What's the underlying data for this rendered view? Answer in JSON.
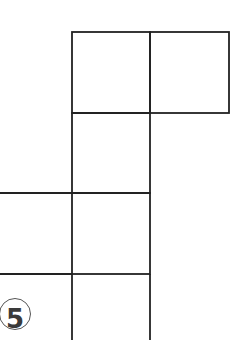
{
  "figure": {
    "label": "5",
    "line_color": "#222222",
    "cells": [
      {
        "x": 72,
        "y": 32,
        "w": 78,
        "h": 81
      },
      {
        "x": 150,
        "y": 32,
        "w": 79,
        "h": 81
      },
      {
        "x": 72,
        "y": 113,
        "w": 78,
        "h": 80
      },
      {
        "x": 0,
        "y": 193,
        "w": 72,
        "h": 81
      },
      {
        "x": 72,
        "y": 193,
        "w": 78,
        "h": 81
      },
      {
        "x": 72,
        "y": 274,
        "w": 78,
        "h": 66
      }
    ]
  }
}
